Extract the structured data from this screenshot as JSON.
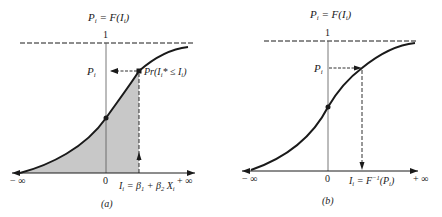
{
  "figure": {
    "panels": [
      {
        "id": "a",
        "caption": "(a)",
        "title_lhs": "P",
        "title_lhs_sub": "i",
        "title_eq": " = F(I",
        "title_sub": "i",
        "title_end": ")",
        "y_top_label": "1",
        "p_label": "P",
        "p_label_sub": "i",
        "prob_label": "Pr(I",
        "prob_label_sub": "i",
        "prob_label_rest": "* ≤ I",
        "prob_label_sub2": "i",
        "prob_label_end": ")",
        "x_left_label": "− ∞",
        "x_origin_label": "0",
        "x_right_label": "+ ∞",
        "index_label": "I",
        "index_label_sub": "i",
        "index_label_eq": " = β",
        "index_beta1_sub": "1",
        "index_plus": " + β",
        "index_beta2_sub": "2",
        "index_x": " X",
        "index_x_sub": "i",
        "shaded": true
      },
      {
        "id": "b",
        "caption": "(b)",
        "title_lhs": "P",
        "title_lhs_sub": "i",
        "title_eq": " = F(I",
        "title_sub": "i",
        "title_end": ")",
        "y_top_label": "1",
        "p_label": "P",
        "p_label_sub": "i",
        "x_left_label": "− ∞",
        "x_origin_label": "0",
        "x_right_label": "+ ∞",
        "index_label": "I",
        "index_label_sub": "i",
        "index_label_eq": " = F",
        "index_inv_sup": "−1",
        "index_arg": "(P",
        "index_arg_sub": "i",
        "index_end": ")",
        "shaded": false
      }
    ],
    "colors": {
      "ink": "#1a1a1a",
      "axis": "#555555",
      "shade": "#c8c8c8",
      "background": "#ffffff"
    }
  }
}
